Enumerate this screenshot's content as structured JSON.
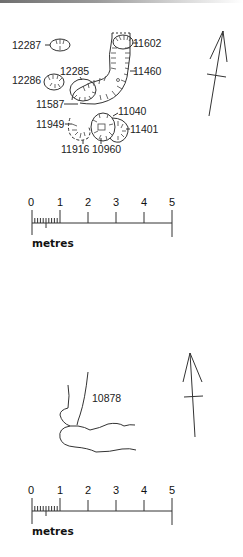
{
  "plan_1": {
    "features": [
      {
        "id": "12287",
        "label": "12287"
      },
      {
        "id": "11602",
        "label": "11602"
      },
      {
        "id": "11460",
        "label": "11460"
      },
      {
        "id": "12286",
        "label": "12286"
      },
      {
        "id": "12285",
        "label": "12285"
      },
      {
        "id": "11587",
        "label": "11587"
      },
      {
        "id": "11040",
        "label": "11040"
      },
      {
        "id": "11949",
        "label": "11949"
      },
      {
        "id": "11401",
        "label": "11401"
      },
      {
        "id": "11916",
        "label": "11916"
      },
      {
        "id": "10960",
        "label": "10960"
      }
    ],
    "north_arrow": "north-arrow",
    "scale": {
      "ticks": [
        "0",
        "1",
        "2",
        "3",
        "4",
        "5"
      ],
      "unit": "metres"
    }
  },
  "plan_2": {
    "features": [
      {
        "id": "10878",
        "label": "10878"
      }
    ],
    "north_arrow": "north-arrow",
    "scale": {
      "ticks": [
        "0",
        "1",
        "2",
        "3",
        "4",
        "5"
      ],
      "unit": "metres"
    }
  },
  "colors": {
    "ink": "#222222",
    "background": "#ffffff"
  }
}
